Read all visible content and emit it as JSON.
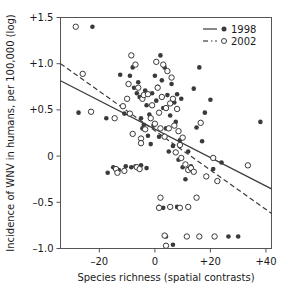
{
  "chart_data": {
    "type": "scatter",
    "title": "",
    "xlabel": "Species richness (spatial contrasts)",
    "ylabel": "Incidence of WNV in humans, per 100,000 (log)",
    "xlim": [
      -34,
      42
    ],
    "ylim": [
      -1.0,
      1.5
    ],
    "xticks": [
      -20,
      0,
      20,
      40
    ],
    "xticklabels": [
      "–20",
      "0",
      "+20",
      "+40"
    ],
    "yticks": [
      -1.0,
      -0.5,
      0,
      0.5,
      1.0,
      1.5
    ],
    "yticklabels": [
      "–1.0",
      "–0.5",
      "0",
      "+0.5",
      "+1.0",
      "+1.5"
    ],
    "grid": false,
    "legend_position": "top-right",
    "series": [
      {
        "name": "1998",
        "marker": "filled-circle",
        "color": "#3a3a3a",
        "line_style": "solid",
        "trendline": {
          "x": [
            -34,
            42
          ],
          "y": [
            0.815,
            -0.355
          ]
        },
        "points": [
          [
            -22.5,
            1.4
          ],
          [
            -27.5,
            0.47
          ],
          [
            -17.5,
            0.41
          ],
          [
            -12.5,
            0.88
          ],
          [
            -11.0,
            0.46
          ],
          [
            -9.0,
            0.87
          ],
          [
            -8.0,
            0.96
          ],
          [
            -7.5,
            0.74
          ],
          [
            -6.5,
            0.68
          ],
          [
            -6.0,
            0.8
          ],
          [
            -5.5,
            0.64
          ],
          [
            -5.0,
            0.41
          ],
          [
            -4.5,
            0.3
          ],
          [
            -4.0,
            0.34
          ],
          [
            -3.5,
            0.71
          ],
          [
            -3.0,
            0.55
          ],
          [
            -2.5,
            0.22
          ],
          [
            -2.0,
            0.45
          ],
          [
            -1.5,
            0.13
          ],
          [
            -1.0,
            0.68
          ],
          [
            -0.5,
            0.33
          ],
          [
            0.0,
            0.87
          ],
          [
            0.5,
            0.6
          ],
          [
            1.0,
            0.75
          ],
          [
            1.5,
            0.21
          ],
          [
            2.0,
            1.09
          ],
          [
            2.5,
            0.82
          ],
          [
            3.0,
            0.52
          ],
          [
            3.5,
            0.96
          ],
          [
            4.0,
            0.3
          ],
          [
            4.5,
            0.66
          ],
          [
            5.0,
            0.05
          ],
          [
            5.5,
            0.44
          ],
          [
            6.0,
            0.78
          ],
          [
            6.5,
            0.11
          ],
          [
            7.0,
            0.58
          ],
          [
            7.5,
            0.37
          ],
          [
            8.0,
            0.67
          ],
          [
            8.5,
            -0.04
          ],
          [
            9.0,
            0.17
          ],
          [
            9.5,
            0.62
          ],
          [
            10.0,
            -0.12
          ],
          [
            11.0,
            -0.25
          ],
          [
            12.0,
            0.05
          ],
          [
            13.0,
            -0.11
          ],
          [
            14.0,
            0.73
          ],
          [
            15.0,
            0.31
          ],
          [
            16.0,
            0.96
          ],
          [
            17.0,
            0.16
          ],
          [
            18.0,
            0.47
          ],
          [
            20.0,
            0.61
          ],
          [
            21.0,
            -0.14
          ],
          [
            24.0,
            -0.07
          ],
          [
            26.5,
            -0.87
          ],
          [
            30.0,
            -0.87
          ],
          [
            38.0,
            0.37
          ],
          [
            -15.0,
            -0.12
          ],
          [
            -13.0,
            -0.15
          ],
          [
            -10.5,
            -0.11
          ],
          [
            -8.5,
            -0.12
          ],
          [
            -7.0,
            -0.11
          ],
          [
            -5.0,
            -0.1
          ],
          [
            -3.0,
            -0.13
          ],
          [
            1.5,
            -0.55
          ],
          [
            3.0,
            -0.56
          ],
          [
            4.0,
            -0.87
          ],
          [
            6.5,
            -0.96
          ],
          [
            8.0,
            -0.55
          ],
          [
            -17.0,
            -0.18
          ]
        ]
      },
      {
        "name": "2002",
        "marker": "open-circle",
        "color": "#3a3a3a",
        "line_style": "dashed",
        "trendline": {
          "x": [
            -34,
            42
          ],
          "y": [
            1.0,
            -0.62
          ]
        },
        "points": [
          [
            -28.5,
            1.4
          ],
          [
            -26.0,
            0.89
          ],
          [
            -23.0,
            0.48
          ],
          [
            -14.5,
            0.41
          ],
          [
            -11.5,
            0.54
          ],
          [
            -10.0,
            0.62
          ],
          [
            -9.5,
            0.78
          ],
          [
            -8.5,
            1.09
          ],
          [
            -7.0,
            0.99
          ],
          [
            -6.0,
            0.74
          ],
          [
            -5.0,
            0.19
          ],
          [
            -5.0,
            0.14
          ],
          [
            -4.5,
            0.62
          ],
          [
            -4.0,
            0.66
          ],
          [
            -3.5,
            0.29
          ],
          [
            -2.5,
            0.67
          ],
          [
            -1.5,
            0.41
          ],
          [
            -1.0,
            0.55
          ],
          [
            0.0,
            0.35
          ],
          [
            0.5,
            1.02
          ],
          [
            1.0,
            0.74
          ],
          [
            1.5,
            0.47
          ],
          [
            2.0,
            0.3
          ],
          [
            2.5,
            0.64
          ],
          [
            3.0,
            0.99
          ],
          [
            3.5,
            0.21
          ],
          [
            4.0,
            0.52
          ],
          [
            4.5,
            0.92
          ],
          [
            5.0,
            0.3
          ],
          [
            5.5,
            0.57
          ],
          [
            6.0,
            0.85
          ],
          [
            6.5,
            0.62
          ],
          [
            7.0,
            0.33
          ],
          [
            7.5,
            0.04
          ],
          [
            8.0,
            0.51
          ],
          [
            8.5,
            0.27
          ],
          [
            9.0,
            0.12
          ],
          [
            9.5,
            -0.02
          ],
          [
            10.0,
            0.2
          ],
          [
            11.0,
            -0.09
          ],
          [
            12.0,
            -0.15
          ],
          [
            13.0,
            -0.13
          ],
          [
            14.0,
            -0.17
          ],
          [
            16.5,
            0.36
          ],
          [
            18.5,
            -0.22
          ],
          [
            21.0,
            -0.02
          ],
          [
            22.5,
            -0.27
          ],
          [
            33.5,
            -0.1
          ],
          [
            -14.0,
            -0.14
          ],
          [
            -13.5,
            -0.18
          ],
          [
            -11.0,
            -0.16
          ],
          [
            -6.5,
            -0.12
          ],
          [
            -5.5,
            -0.14
          ],
          [
            2.0,
            -0.45
          ],
          [
            1.5,
            -0.56
          ],
          [
            5.5,
            -0.55
          ],
          [
            9.0,
            -0.56
          ],
          [
            12.0,
            -0.55
          ],
          [
            15.0,
            -0.45
          ],
          [
            3.5,
            -0.86
          ],
          [
            4.0,
            -0.97
          ],
          [
            11.5,
            -0.87
          ],
          [
            16.0,
            -0.87
          ],
          [
            21.5,
            -0.87
          ],
          [
            -9.0,
            0.46
          ],
          [
            -8.0,
            0.24
          ]
        ]
      }
    ]
  },
  "legend": {
    "entries": [
      {
        "label": "1998",
        "line_style": "solid",
        "marker": "filled-circle"
      },
      {
        "label": "2002",
        "line_style": "dash-dot",
        "marker": "open-circle"
      }
    ]
  },
  "axes": {
    "x_title": "Species richness (spatial contrasts)",
    "y_title": "Incidence of WNV in humans, per 100,000 (log)"
  }
}
